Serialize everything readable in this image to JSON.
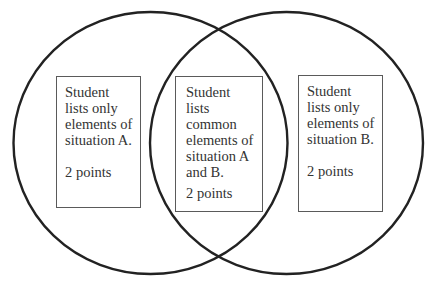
{
  "diagram": {
    "type": "venn",
    "stroke_color": "#222222",
    "sets": [
      {
        "id": "A",
        "label": "situation A"
      },
      {
        "id": "B",
        "label": "situation B"
      }
    ],
    "regions": [
      {
        "id": "only-a",
        "lines": [
          "Student",
          "lists only",
          "elements of",
          "situation A."
        ],
        "points": "2 points"
      },
      {
        "id": "a-and-b",
        "lines": [
          "Student",
          "lists",
          "common",
          "elements of",
          "situation A",
          "and B."
        ],
        "points": "2 points"
      },
      {
        "id": "only-b",
        "lines": [
          "Student",
          "lists only",
          "elements of",
          "situation B."
        ],
        "points": "2 points"
      }
    ]
  }
}
